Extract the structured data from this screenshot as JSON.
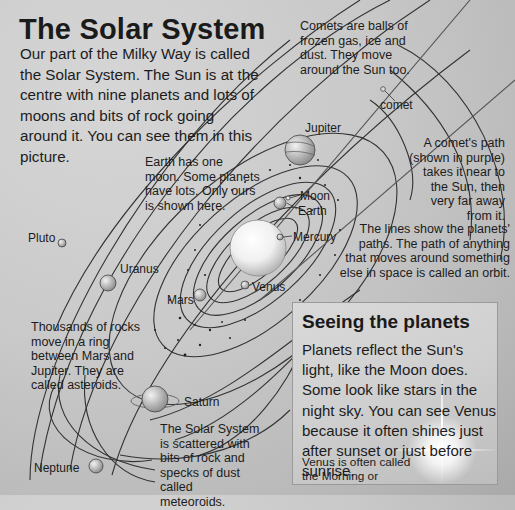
{
  "page": {
    "title": "The Solar System",
    "intro": "Our part of the Milky Way is called the Solar System. The Sun is at the centre with nine planets and lots of moons and bits of rock going around it. You can see them in this picture."
  },
  "notes": {
    "comets": "Comets are balls of frozen gas, ice and dust. They move around the Sun too.",
    "comet_path": "A comet's path (shown in purple) takes it near to the Sun, then very far away from it.",
    "earth_moon": "Earth has one moon. Some planets have lots. Only ours is shown here.",
    "orbits": "The lines show the planets' paths. The path of anything that moves around something else in space is called an orbit.",
    "asteroids": "Thousands of rocks move in a ring between Mars and Jupiter. They are called asteroids.",
    "meteoroids": "The Solar System is scattered with bits of rock and specks of dust called meteoroids."
  },
  "labels": {
    "comet": "comet",
    "jupiter": "Jupiter",
    "moon": "Moon",
    "earth": "Earth",
    "mercury": "Mercury",
    "venus": "Venus",
    "mars": "Mars",
    "uranus": "Uranus",
    "pluto": "Pluto",
    "saturn": "Saturn",
    "neptune": "Neptune"
  },
  "sidebar_box": {
    "title": "Seeing the planets",
    "body": "Planets reflect the Sun's light, like the Moon does. Some look like stars in the night sky. You can see Venus because it often shines just after sunset or just before sunrise.",
    "note": "Venus is often called the Morning or Evening Star."
  },
  "colors": {
    "background": "#c9c9c9",
    "ink": "#1c1c1c",
    "orbit_line": "#333333",
    "box_background": "#d4d4d4"
  }
}
